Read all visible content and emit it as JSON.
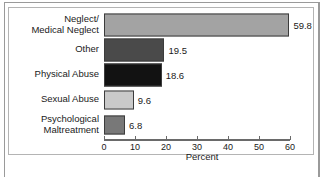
{
  "chart_data": {
    "type": "bar",
    "orientation": "horizontal",
    "title": "",
    "xlabel": "Percent",
    "ylabel": "",
    "xlim": [
      0,
      60
    ],
    "xticks": [
      0,
      10,
      20,
      30,
      40,
      50,
      60
    ],
    "xtick_labels": [
      "0",
      "10",
      "20",
      "30",
      "40",
      "50",
      "60"
    ],
    "grid": false,
    "legend": "none",
    "categories": [
      "Neglect/\nMedical Neglect",
      "Other",
      "Physical Abuse",
      "Sexual Abuse",
      "Psychological\nMaltreatment"
    ],
    "values": [
      59.8,
      19.5,
      18.6,
      9.6,
      6.8
    ],
    "value_labels": [
      "59.8",
      "19.5",
      "18.6",
      "9.6",
      "6.8"
    ],
    "bar_colors": [
      "#a3a3a3",
      "#4a4a4a",
      "#121212",
      "#c9c9c9",
      "#787878"
    ],
    "bar_edge_color": "#3c3c3c"
  },
  "colors": {
    "frame": "#9a9a9a",
    "plot_border": "#b4b4b4",
    "axis": "#6a6a6a",
    "text": "#1a1a1a",
    "background": "#ffffff"
  }
}
